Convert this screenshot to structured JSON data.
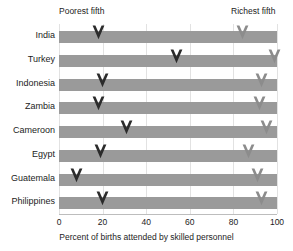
{
  "chart_data": {
    "type": "bar",
    "title": "",
    "xlabel": "Percent of births attended by skilled personnel",
    "ylabel": "",
    "xlim": [
      0,
      100
    ],
    "xticks": [
      0,
      20,
      40,
      60,
      80,
      100
    ],
    "xticklabels": [
      "0",
      "20",
      "40",
      "60",
      "80",
      "100"
    ],
    "grid": true,
    "grid_axis": "x",
    "legend_position": "top",
    "categories": [
      "India",
      "Turkey",
      "Indonesia",
      "Zambia",
      "Cameroon",
      "Egypt",
      "Guatemala",
      "Philippines"
    ],
    "series": [
      {
        "name": "Poorest fifth",
        "color": "#2b2b2b",
        "values": [
          18,
          54,
          20,
          18,
          31,
          19,
          8,
          20
        ]
      },
      {
        "name": "Richest fifth",
        "color": "#8c8c8c",
        "values": [
          84,
          99,
          93,
          92,
          95,
          87,
          91,
          93
        ]
      }
    ],
    "annotations": [
      {
        "text": "Poorest fifth",
        "x": 18
      },
      {
        "text": "Richest fifth",
        "x": 84
      }
    ]
  },
  "axis": {
    "x_title": "Percent of births attended by skilled personnel",
    "tick_labels": [
      "0",
      "20",
      "40",
      "60",
      "80",
      "100"
    ]
  },
  "labels": {
    "poorest": "Poorest fifth",
    "richest": "Richest fifth",
    "countries": [
      "India",
      "Turkey",
      "Indonesia",
      "Zambia",
      "Cameroon",
      "Egypt",
      "Guatemala",
      "Philippines"
    ]
  },
  "colors": {
    "bar": "#9a9a9a",
    "poorest_marker": "#2b2b2b",
    "richest_marker": "#8c8c8c",
    "gridline": "#e2e2e2",
    "axis": "#bdbdbd",
    "text": "#1c1c1c",
    "background": "#ffffff"
  },
  "top_sliver": ""
}
